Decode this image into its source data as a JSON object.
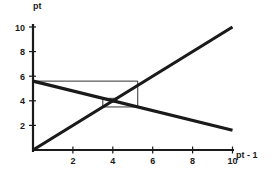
{
  "figure": {
    "kind": "cobweb-diagram",
    "background_color": "#ffffff",
    "line_color": "#1a1a1a"
  },
  "axes": {
    "y_axis_label": "pt",
    "x_axis_label": "pt - 1",
    "x_ticks": [
      "2",
      "4",
      "6",
      "8",
      "10"
    ],
    "y_ticks": [
      "2",
      "4",
      "6",
      "8",
      "10"
    ]
  },
  "chart_data": {
    "type": "line",
    "title": "",
    "xlabel": "pt - 1",
    "ylabel": "pt",
    "xlim": [
      0,
      10.6
    ],
    "ylim": [
      0,
      10.6
    ],
    "xticks": [
      2,
      4,
      6,
      8,
      10
    ],
    "yticks": [
      2,
      4,
      6,
      8,
      10
    ],
    "grid": false,
    "legend": "none",
    "series": [
      {
        "name": "45-degree line",
        "style": "thick",
        "x": [
          0,
          10
        ],
        "y": [
          0,
          10
        ]
      },
      {
        "name": "adjustment line",
        "style": "thick",
        "x": [
          0,
          10
        ],
        "y": [
          5.6,
          1.6
        ]
      },
      {
        "name": "cobweb path",
        "style": "thin",
        "x": [
          0,
          5.25,
          5.25,
          3.5,
          3.5,
          4.2,
          4.2,
          3.9
        ],
        "y": [
          5.6,
          5.6,
          3.5,
          3.5,
          4.2,
          4.2,
          3.9,
          3.9
        ]
      }
    ],
    "annotations": {
      "fixed_point_x": 4,
      "fixed_point_y": 4
    }
  }
}
